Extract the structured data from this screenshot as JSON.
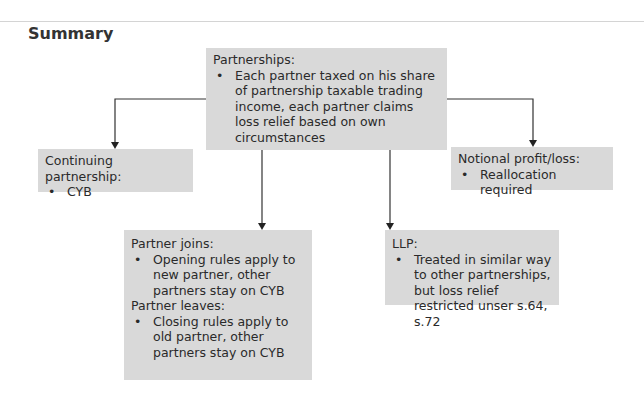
{
  "title": "Summary",
  "nodes": {
    "root": {
      "heading": "Partnerships:",
      "bullets": [
        "Each partner taxed on his share of partnership taxable trading income, each partner claims loss relief based on own circumstances"
      ]
    },
    "continuing": {
      "heading": "Continuing partnership:",
      "bullets": [
        "CYB"
      ]
    },
    "notional": {
      "heading": "Notional profit/loss:",
      "bullets": [
        "Reallocation required"
      ]
    },
    "joins_leaves": {
      "heading": "Partner joins:",
      "bullets": [
        "Opening rules apply to new partner, other partners stay on CYB"
      ],
      "heading2": "Partner leaves:",
      "bullets2": [
        "Closing rules apply to old partner, other partners stay on CYB"
      ]
    },
    "llp": {
      "heading": "LLP:",
      "bullets": [
        "Treated in similar way to other partnerships, but loss relief restricted unser s.64, s.72"
      ]
    }
  },
  "edges": [
    {
      "from": "root",
      "to": "continuing"
    },
    {
      "from": "root",
      "to": "notional"
    },
    {
      "from": "root",
      "to": "joins_leaves"
    },
    {
      "from": "root",
      "to": "llp"
    }
  ]
}
